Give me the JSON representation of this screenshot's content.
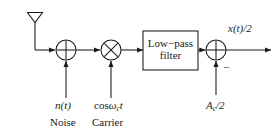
{
  "figure": {
    "type": "block-diagram",
    "background_color": "#ffffff",
    "line_color": "#1a1a1a",
    "text_color": "#1a1a1a"
  },
  "nodes": {
    "antenna": {
      "name": "antenna",
      "label": ""
    },
    "summer1": {
      "name": "summing-junction",
      "operator": "+",
      "cx": 66,
      "cy": 50,
      "r": 10
    },
    "multiplier": {
      "name": "multiplier",
      "operator": "×",
      "cx": 111,
      "cy": 50,
      "r": 10
    },
    "filter": {
      "name": "low-pass-filter",
      "line1": "Low−pass",
      "line2": "filter",
      "x": 143,
      "y": 31,
      "w": 55,
      "h": 39
    },
    "summer2": {
      "name": "summing-junction-2",
      "operator": "+",
      "cx": 216,
      "cy": 50,
      "r": 10,
      "minus_sign": "−"
    }
  },
  "labels": {
    "noise_math": "n(t)",
    "noise_text": "Noise",
    "carrier_math_prefix": "cos",
    "carrier_math_omega": "ω",
    "carrier_math_sub": "c",
    "carrier_math_t": "t",
    "carrier_text": "Carrier",
    "dc_offset_main": "A",
    "dc_offset_sub": "c",
    "dc_offset_tail": "/2",
    "output_main": "x",
    "output_paren": "(t)/2"
  }
}
